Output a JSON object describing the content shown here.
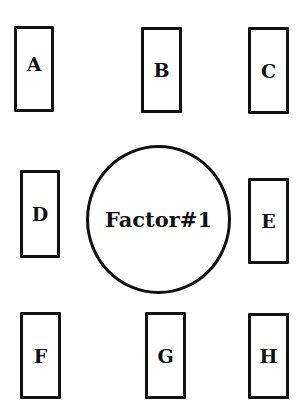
{
  "diagram": {
    "center": {
      "label": "Factor#1",
      "shape": "circle"
    },
    "nodes": [
      {
        "id": "A",
        "label": "A",
        "shape": "rectangle"
      },
      {
        "id": "B",
        "label": "B",
        "shape": "rectangle"
      },
      {
        "id": "C",
        "label": "C",
        "shape": "rectangle"
      },
      {
        "id": "D",
        "label": "D",
        "shape": "rectangle"
      },
      {
        "id": "E",
        "label": "E",
        "shape": "rectangle"
      },
      {
        "id": "F",
        "label": "F",
        "shape": "rectangle"
      },
      {
        "id": "G",
        "label": "G",
        "shape": "rectangle"
      },
      {
        "id": "H",
        "label": "H",
        "shape": "rectangle"
      }
    ],
    "colors": {
      "stroke": "#111111",
      "background": "#ffffff"
    }
  }
}
